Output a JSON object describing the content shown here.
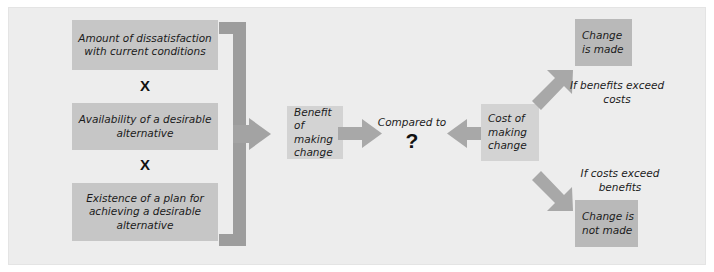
{
  "diagram": {
    "colors": {
      "panel_background": "#ededed",
      "page_background": "#ffffff",
      "box_light": "#d3d3d3",
      "box_mid": "#c6c6c6",
      "box_dark": "#b9b9b9",
      "arrow_fill": "#a8a8a8",
      "brace_fill": "#9d9d9d",
      "text": "#1b1b1b"
    },
    "factors": [
      {
        "id": "dissatisfaction",
        "label": "Amount of dissatisfaction with current conditions"
      },
      {
        "id": "availability",
        "label": "Availability of a desirable alternative"
      },
      {
        "id": "plan",
        "label": "Existence of a plan for achieving a desirable alternative"
      }
    ],
    "operators": [
      {
        "id": "multiply-1",
        "symbol": "X"
      },
      {
        "id": "multiply-2",
        "symbol": "X"
      }
    ],
    "benefit_box": {
      "id": "benefit",
      "label": "Benefit of making change"
    },
    "compare_node": {
      "id": "compared-to",
      "label": "Compared to",
      "symbol": "?"
    },
    "cost_box": {
      "id": "cost",
      "label": "Cost of making change"
    },
    "branches": [
      {
        "id": "positive",
        "condition": "If benefits exceed costs",
        "outcome": "Change is made"
      },
      {
        "id": "negative",
        "condition": "If costs exceed benefits",
        "outcome": "Change is not made"
      }
    ],
    "icons": {
      "brace_arrow": "brace-right-arrow-icon",
      "arrow_right": "arrow-right-icon",
      "arrow_left": "arrow-left-icon",
      "arrow_up_right": "arrow-up-right-icon",
      "arrow_down_right": "arrow-down-right-icon"
    }
  }
}
